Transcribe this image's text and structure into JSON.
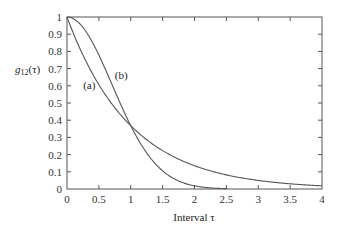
{
  "chart_data": {
    "type": "line",
    "title": "",
    "xlabel": "Interval τ",
    "ylabel": "g12(τ)",
    "ylabel_main": "g",
    "ylabel_sub": "12",
    "ylabel_arg": "(τ)",
    "xlim": [
      0,
      4
    ],
    "ylim": [
      0,
      1
    ],
    "grid": false,
    "frame": "box",
    "x_ticks": [
      0,
      0.5,
      1,
      1.5,
      2,
      2.5,
      3,
      3.5,
      4
    ],
    "x_tick_labels": [
      "0",
      "0.5",
      "1",
      "1.5",
      "2",
      "2.5",
      "3",
      "3.5",
      "4"
    ],
    "y_ticks": [
      0,
      0.1,
      0.2,
      0.3,
      0.4,
      0.5,
      0.6,
      0.7,
      0.8,
      0.9,
      1
    ],
    "y_tick_labels": [
      "0",
      "0.1",
      "0.2",
      "0.3",
      "0.4",
      "0.5",
      "0.6",
      "0.7",
      "0.8",
      "0.9",
      "1"
    ],
    "series": [
      {
        "name": "(a)",
        "description": "exponential decay exp(-τ)",
        "x": [
          0,
          0.25,
          0.5,
          0.75,
          1,
          1.25,
          1.5,
          1.75,
          2,
          2.5,
          3,
          3.5,
          4
        ],
        "values": [
          1,
          0.78,
          0.61,
          0.47,
          0.37,
          0.29,
          0.22,
          0.17,
          0.14,
          0.08,
          0.05,
          0.03,
          0.02
        ],
        "label_pos": {
          "x": 0.35,
          "y": 0.58
        }
      },
      {
        "name": "(b)",
        "description": "Gaussian decay exp(-τ²)",
        "x": [
          0,
          0.25,
          0.5,
          0.75,
          1,
          1.25,
          1.5,
          1.75,
          2,
          2.25,
          2.5
        ],
        "values": [
          1,
          0.94,
          0.78,
          0.57,
          0.37,
          0.21,
          0.11,
          0.05,
          0.02,
          0.006,
          0.002
        ],
        "label_pos": {
          "x": 0.85,
          "y": 0.64
        }
      }
    ],
    "annotations": [
      {
        "text": "(a)",
        "x": 0.35,
        "y": 0.58
      },
      {
        "text": "(b)",
        "x": 0.85,
        "y": 0.64
      }
    ],
    "legend": "none (inline labels)"
  }
}
